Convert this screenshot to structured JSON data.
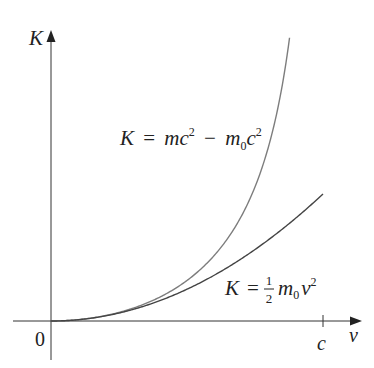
{
  "chart_data": {
    "type": "line",
    "title": "",
    "xlabel": "v",
    "ylabel": "K",
    "x_ticks": [
      {
        "label": "0",
        "value": 0
      },
      {
        "label": "c",
        "value": 1
      }
    ],
    "xlim": [
      0,
      1
    ],
    "grid": false,
    "legend": "inline annotations",
    "series": [
      {
        "name": "K = mc² − m₀c²",
        "formula": "relativistic",
        "x": [
          0,
          0.1,
          0.2,
          0.3,
          0.4,
          0.5,
          0.6,
          0.7,
          0.8,
          0.85,
          0.875
        ],
        "y": [
          0,
          0.005,
          0.021,
          0.048,
          0.091,
          0.155,
          0.25,
          0.4,
          0.667,
          0.898,
          1.066
        ]
      },
      {
        "name": "K = ½ m₀v²",
        "formula": "classical",
        "x": [
          0,
          0.1,
          0.2,
          0.3,
          0.4,
          0.5,
          0.6,
          0.7,
          0.8,
          0.9,
          1.0
        ],
        "y": [
          0,
          0.005,
          0.02,
          0.045,
          0.08,
          0.125,
          0.18,
          0.245,
          0.32,
          0.405,
          0.5
        ]
      }
    ],
    "y_units": "m₀c²",
    "x_units": "c"
  },
  "labels": {
    "y_axis": "K",
    "x_axis": "v",
    "origin": "0",
    "c_tick": "c",
    "relativistic": {
      "K": "K",
      "eq": "=",
      "m": "m",
      "c": "c",
      "sup": "2",
      "minus": "−",
      "m0": "m",
      "sub0": "0",
      "c2": "c",
      "sup2": "2"
    },
    "classical": {
      "K": "K",
      "eq": "=",
      "num": "1",
      "den": "2",
      "m": "m",
      "sub0": "0",
      "v": "v",
      "sup": "2"
    }
  },
  "colors": {
    "axis": "#333333",
    "relativistic_curve": "#7a7a7a",
    "classical_curve": "#4a4a4a"
  }
}
